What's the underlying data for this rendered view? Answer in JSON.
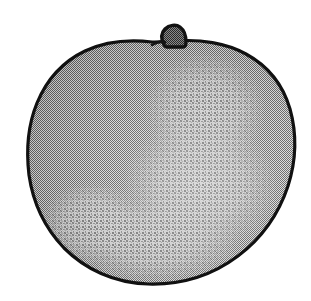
{
  "image": {
    "kind": "scanned-line-drawing",
    "subject_label": "apple",
    "caption": "apple",
    "background_color": "#ffffff",
    "width_px": 311,
    "height_px": 301,
    "palette": {
      "background": "#ffffff",
      "outline": "#111111",
      "body_fill_mid": "#9c9c9c",
      "body_fill_light": "#c2c2c2",
      "body_fill_dark": "#868686",
      "stem_fill": "#6e6e6e",
      "stem_outline": "#121212"
    }
  },
  "shapes": {
    "body": {
      "name": "fruit-body",
      "bounds": {
        "x": 27,
        "y": 38,
        "width": 268,
        "height": 247
      },
      "outline_width_px": 3,
      "path": "M 152 42 C 126 39 104 42 85 51 C 64 61 47 79 37 103 C 28 125 26 150 29 175 C 33 203 45 228 64 248 C 85 269 114 283 148 284 C 183 285 214 274 238 256 C 262 238 279 213 288 186 C 296 161 297 134 290 109 C 283 85 268 66 246 54 C 226 43 200 39 176 41 C 168 41 160 42 152 42 Z"
    },
    "stem": {
      "name": "fruit-stem",
      "bounds": {
        "x": 152,
        "y": 24,
        "width": 36,
        "height": 25
      },
      "outline_width_px": 3,
      "path": "M 164 45 C 161 39 161 33 165 29 C 169 25 176 24 180 27 C 184 30 186 36 186 42 C 186 45 185 47 183 47 L 167 47 C 165 47 165 46 164 45 Z"
    },
    "stem_whisker": {
      "name": "stem-whisker",
      "path": "M 152 45 C 157 42 161 41 165 42"
    },
    "highlight_regions": [
      {
        "name": "upper-right-mottle",
        "cx": 205,
        "cy": 110,
        "rx": 62,
        "ry": 58
      },
      {
        "name": "center-right-mottle",
        "cx": 200,
        "cy": 185,
        "rx": 78,
        "ry": 66
      },
      {
        "name": "lower-center-mottle",
        "cx": 155,
        "cy": 240,
        "rx": 86,
        "ry": 42
      },
      {
        "name": "lower-left-mottle",
        "cx": 92,
        "cy": 222,
        "rx": 52,
        "ry": 40
      }
    ]
  },
  "annotations": {
    "alt_text": "Black and white halftone line drawing of an apple with a short stem at the top",
    "title_text": "apple"
  }
}
